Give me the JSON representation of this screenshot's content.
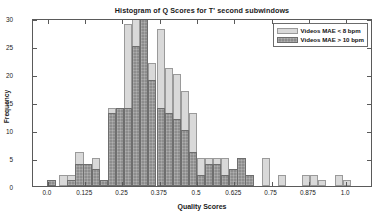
{
  "chart_data": {
    "type": "bar",
    "subtype": "overlaid-histogram",
    "title": "Histogram of Q Scores for T' second subwindows",
    "xlabel": "Quality Scores",
    "ylabel": "Frequency",
    "xlim": [
      -0.05,
      1.09
    ],
    "ylim": [
      0,
      30
    ],
    "grid": false,
    "legend_position": "top-right",
    "xticks": [
      "0.0",
      "0.125",
      "0.25",
      "0.375",
      "0.5",
      "0.625",
      "0.75",
      "0.875",
      "1.0"
    ],
    "xtick_values": [
      0.0,
      0.125,
      0.25,
      0.375,
      0.5,
      0.625,
      0.75,
      0.875,
      1.0
    ],
    "yticks": [
      "0",
      "5",
      "10",
      "15",
      "20",
      "25",
      "30"
    ],
    "ytick_values": [
      0,
      5,
      10,
      15,
      20,
      25,
      30
    ],
    "bin_width": 0.0275,
    "bin_centers": [
      0.012,
      0.052,
      0.079,
      0.106,
      0.133,
      0.16,
      0.188,
      0.215,
      0.242,
      0.269,
      0.296,
      0.323,
      0.35,
      0.378,
      0.405,
      0.432,
      0.459,
      0.486,
      0.513,
      0.54,
      0.567,
      0.595,
      0.622,
      0.649,
      0.676,
      0.73,
      0.785,
      0.866,
      0.893,
      0.92,
      0.975,
      1.002
    ],
    "series": [
      {
        "name": "Videos MAE < 8 bpm",
        "color": "#d9d9d9",
        "values": [
          1,
          2,
          2,
          6,
          4,
          5,
          1,
          14,
          8,
          29,
          30,
          30,
          22,
          28,
          21,
          20,
          17,
          13,
          5,
          5,
          5,
          5,
          2,
          2,
          2,
          5,
          2,
          2,
          2,
          1,
          2,
          1
        ]
      },
      {
        "name": "Videos MAE > 10 bpm",
        "color": "#8d8d8d",
        "values": [
          1,
          0,
          1,
          4,
          4,
          3,
          1,
          13,
          14,
          14,
          25,
          30,
          19,
          14,
          13,
          12,
          10,
          6,
          2,
          4,
          4,
          2,
          3,
          5,
          2,
          0,
          0,
          0,
          0,
          0,
          0,
          0
        ]
      }
    ]
  },
  "legend": {
    "entries": [
      {
        "label": "Videos MAE < 8 bpm",
        "swatch": "light"
      },
      {
        "label": "Videos MAE > 10 bpm",
        "swatch": "dark"
      }
    ]
  }
}
